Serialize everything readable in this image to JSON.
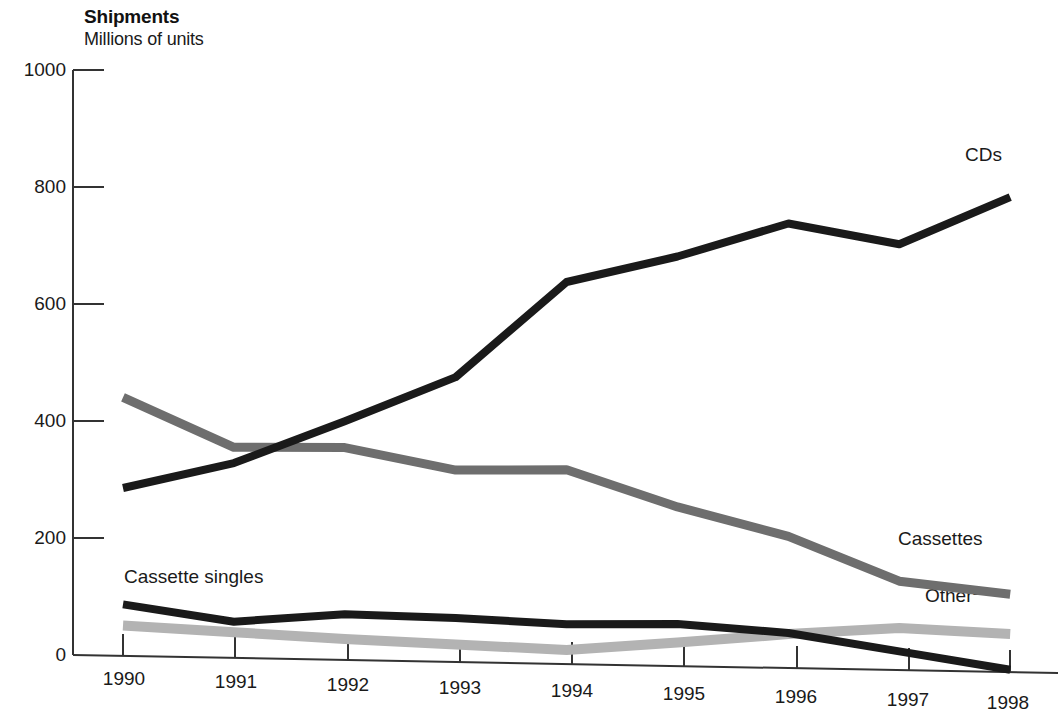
{
  "header": {
    "title": "Shipments",
    "subtitle": "Millions of units"
  },
  "axes": {
    "y_ticks": [
      "1000",
      "800",
      "600",
      "400",
      "200",
      "0"
    ],
    "x_ticks": [
      "1990",
      "1991",
      "1992",
      "1993",
      "1994",
      "1995",
      "1996",
      "1997",
      "1998"
    ]
  },
  "labels": {
    "cds": "CDs",
    "cassettes": "Cassettes",
    "cassette_singles": "Cassette singles",
    "other": "Other",
    "other_footnote": "1"
  },
  "colors": {
    "cds": "#1a1a1a",
    "cassettes": "#6e6e6e",
    "cassette_singles": "#1a1a1a",
    "other": "#b3b3b3",
    "axis": "#333333",
    "background": "#ffffff"
  },
  "chart_data": {
    "type": "line",
    "title": "Shipments",
    "subtitle": "Millions of units",
    "xlabel": "",
    "ylabel": "Millions of units",
    "x": [
      1990,
      1991,
      1992,
      1993,
      1994,
      1995,
      1996,
      1997,
      1998
    ],
    "categories": [
      "1990",
      "1991",
      "1992",
      "1993",
      "1994",
      "1995",
      "1996",
      "1997",
      "1998"
    ],
    "ylim": [
      0,
      1000
    ],
    "yticks": [
      0,
      200,
      400,
      600,
      800,
      1000
    ],
    "grid": false,
    "legend": "inline-right-labels",
    "series": [
      {
        "name": "CDs",
        "color": "#1a1a1a",
        "values": [
          287,
          333,
          408,
          487,
          653,
          700,
          760,
          728,
          812
        ]
      },
      {
        "name": "Cassettes",
        "color": "#6e6e6e",
        "values": [
          442,
          360,
          363,
          328,
          332,
          272,
          225,
          152,
          133
        ]
      },
      {
        "name": "Cassette singles",
        "color": "#1a1a1a",
        "values": [
          88,
          62,
          78,
          75,
          68,
          72,
          60,
          32,
          4
        ]
      },
      {
        "name": "Other",
        "color": "#b3b3b3",
        "values": [
          52,
          44,
          36,
          30,
          24,
          40,
          58,
          72,
          65
        ]
      }
    ]
  }
}
